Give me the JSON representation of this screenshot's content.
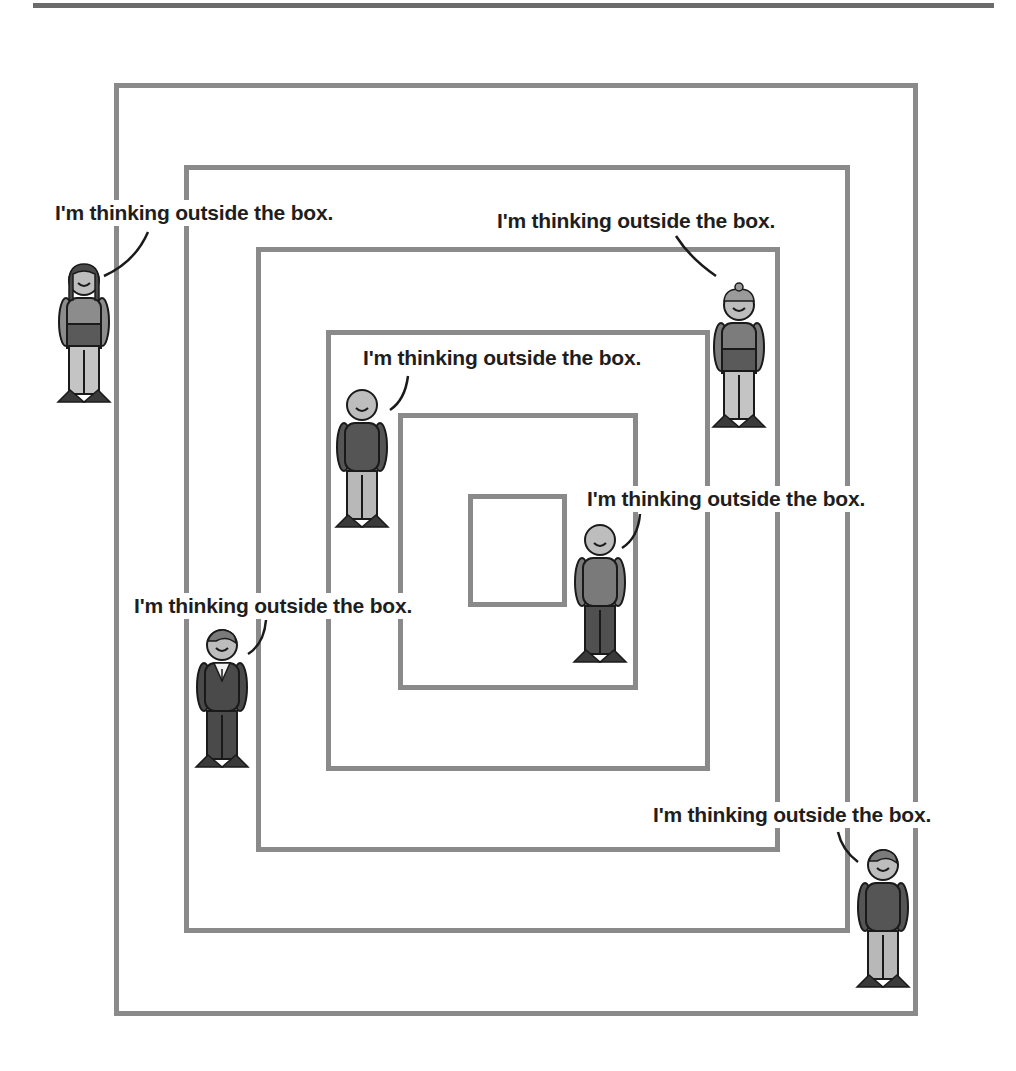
{
  "comic": {
    "boxes": [
      {
        "id": 1,
        "left": 114,
        "top": 83,
        "right": 918,
        "bottom": 1016
      },
      {
        "id": 2,
        "left": 184,
        "top": 165,
        "right": 850,
        "bottom": 933
      },
      {
        "id": 3,
        "left": 256,
        "top": 247,
        "right": 780,
        "bottom": 852
      },
      {
        "id": 4,
        "left": 326,
        "top": 330,
        "right": 710,
        "bottom": 771
      },
      {
        "id": 5,
        "left": 398,
        "top": 413,
        "right": 638,
        "bottom": 690
      },
      {
        "id": 6,
        "left": 468,
        "top": 494,
        "right": 567,
        "bottom": 607
      }
    ],
    "captions": [
      {
        "text": "I'm thinking outside the box.",
        "x": 53,
        "y": 200
      },
      {
        "text": "I'm thinking outside the box.",
        "x": 495,
        "y": 208
      },
      {
        "text": "I'm thinking outside the box.",
        "x": 361,
        "y": 345
      },
      {
        "text": "I'm thinking outside the box.",
        "x": 585,
        "y": 486
      },
      {
        "text": "I'm thinking outside the box.",
        "x": 132,
        "y": 593
      },
      {
        "text": "I'm thinking outside the box.",
        "x": 651,
        "y": 802
      }
    ],
    "figures": [
      {
        "name": "long-hair-figure",
        "x": 58,
        "y": 260,
        "shirt": "#8c8c8c",
        "pants": "#c4c4c4",
        "shorts": "#5a5a5a",
        "hair": "long"
      },
      {
        "name": "beanie-figure",
        "x": 713,
        "y": 285,
        "shirt": "#7c7c7c",
        "pants": "#c4c4c4",
        "shorts": "#5a5a5a",
        "hair": "beanie"
      },
      {
        "name": "bald-figure",
        "x": 336,
        "y": 385,
        "shirt": "#555555",
        "pants": "#b8b8b8",
        "hair": "none"
      },
      {
        "name": "short-figure",
        "x": 574,
        "y": 520,
        "shirt": "#7a7a7a",
        "pants": "#505050",
        "hair": "none"
      },
      {
        "name": "suit-figure",
        "x": 196,
        "y": 625,
        "shirt": "#4a4a4a",
        "pants": "#4a4a4a",
        "hair": "side"
      },
      {
        "name": "casual-figure",
        "x": 857,
        "y": 845,
        "shirt": "#555555",
        "pants": "#b8b8b8",
        "hair": "side"
      }
    ],
    "colors": {
      "box_stroke": "#8a8a8a",
      "rule": "#6b6b6b",
      "text": "#1e1e1e",
      "outline": "#1a1a1a",
      "skin": "#bdbdbd"
    }
  }
}
